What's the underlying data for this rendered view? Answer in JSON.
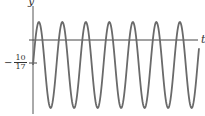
{
  "chart_data": {
    "type": "line",
    "title": "",
    "xlabel": "t",
    "ylabel": "y",
    "grid": false,
    "legend": null,
    "ytick_labels": [
      {
        "label": "-10/17",
        "value": -0.588
      }
    ],
    "series": [
      {
        "name": "y(t)",
        "equation_form": "y = -10/17 + A*sin(w*t)",
        "midline": -0.588,
        "peaks_count": 7,
        "troughs_count": 7,
        "color": "#666666"
      }
    ]
  },
  "labels": {
    "y_axis": "y",
    "t_axis": "t",
    "tick_minus": "−",
    "tick_num": "10",
    "tick_den": "17"
  },
  "colors": {
    "axis": "#333333",
    "curve": "#6a6a6a"
  }
}
